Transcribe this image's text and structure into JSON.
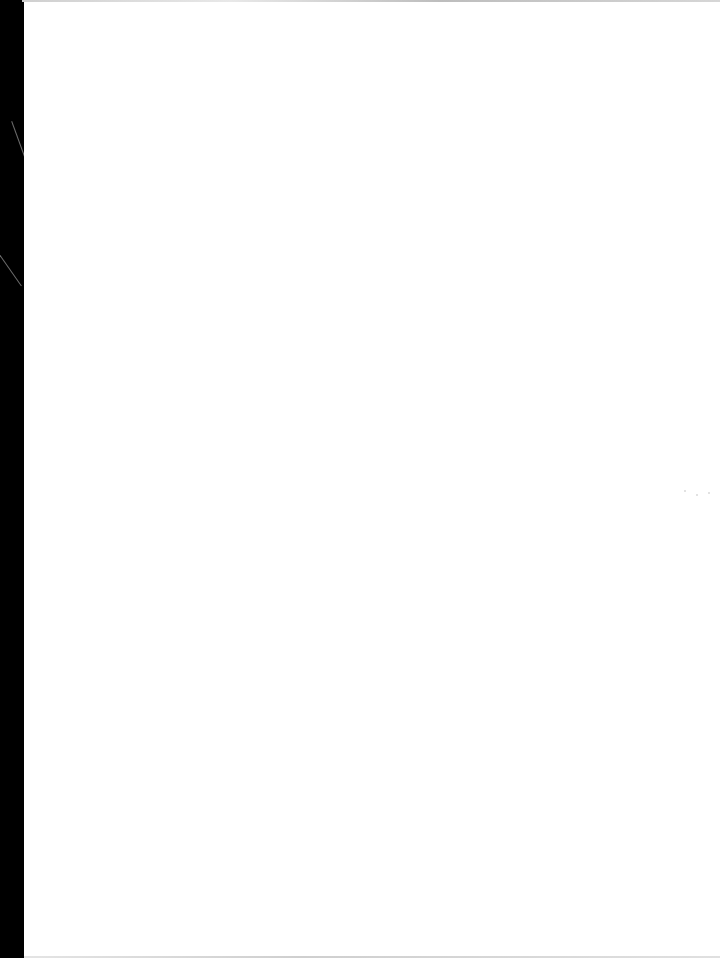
{
  "document": {
    "type": "scanned-page",
    "text_content": "",
    "page_color": "#ffffff",
    "scan_edge_color": "#000000"
  }
}
